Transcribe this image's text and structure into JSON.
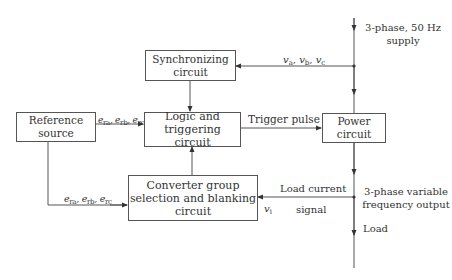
{
  "diagram": {
    "type": "block-diagram",
    "blocks": {
      "synchronizing": {
        "line1": "Synchronizing",
        "line2": "circuit"
      },
      "logic": {
        "line1": "Logic and",
        "line2": "triggering circuit"
      },
      "reference": {
        "line1": "Reference",
        "line2": "source"
      },
      "power": {
        "line1": "Power",
        "line2": "circuit"
      },
      "converter": {
        "line1": "Converter group",
        "line2": "selection and blanking",
        "line3": "circuit"
      }
    },
    "labels": {
      "supply_line1": "3-phase, 50 Hz",
      "supply_line2": "supply",
      "sync_signals": {
        "v": "v",
        "a": "a",
        "b": "b",
        "c": "c"
      },
      "ref_to_logic": {
        "e": "e",
        "ra": "ra",
        "rb": "rb",
        "rc": "rc"
      },
      "ref_to_converter": {
        "e": "e",
        "ra": "ra",
        "rb": "rb",
        "rc": "rc"
      },
      "trigger_pulse": "Trigger pulse",
      "load_current_line1": "Load current",
      "load_current_line2": "signal",
      "vi": {
        "v": "v",
        "i": "i"
      },
      "output_line1": "3-phase variable",
      "output_line2": "frequency output",
      "load": "Load"
    },
    "connections": [
      {
        "from": "supply",
        "to": "power"
      },
      {
        "from": "supply",
        "to": "synchronizing",
        "label": "va, vb, vc"
      },
      {
        "from": "synchronizing",
        "to": "logic"
      },
      {
        "from": "reference",
        "to": "logic",
        "label": "era, erb, erc"
      },
      {
        "from": "reference",
        "to": "converter",
        "label": "era, erb, erc"
      },
      {
        "from": "converter",
        "to": "logic"
      },
      {
        "from": "logic",
        "to": "power",
        "label": "Trigger pulse"
      },
      {
        "from": "power",
        "to": "load"
      },
      {
        "from": "output",
        "to": "converter",
        "label": "Load current signal vi"
      }
    ]
  }
}
